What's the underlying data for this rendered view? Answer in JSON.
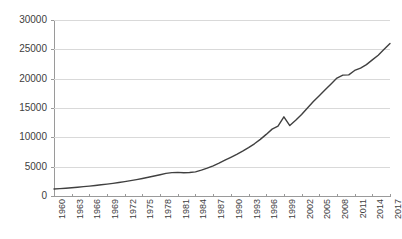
{
  "chart_data": {
    "type": "line",
    "title": "",
    "subtitle": "",
    "xlabel": "",
    "ylabel": "",
    "ylim": [
      0,
      30000
    ],
    "xlim": [
      1960,
      2017
    ],
    "grid": true,
    "legend": false,
    "legend_position": "none",
    "line_color": "#404040",
    "gridline_color": "#d9d9d9",
    "axis_color": "#9a9a9a",
    "y_ticks": [
      0,
      5000,
      10000,
      15000,
      20000,
      25000,
      30000
    ],
    "y_tick_labels": [
      "0",
      "5000",
      "10000",
      "15000",
      "20000",
      "25000",
      "30000"
    ],
    "x_tick_labels": [
      "1960",
      "1963",
      "1966",
      "1969",
      "1972",
      "1975",
      "1978",
      "1981",
      "1984",
      "1987",
      "1990",
      "1993",
      "1996",
      "1999",
      "2002",
      "2005",
      "2008",
      "2011",
      "2014",
      "2017"
    ],
    "x": [
      1960,
      1961,
      1962,
      1963,
      1964,
      1965,
      1966,
      1967,
      1968,
      1969,
      1970,
      1971,
      1972,
      1973,
      1974,
      1975,
      1976,
      1977,
      1978,
      1979,
      1980,
      1981,
      1982,
      1983,
      1984,
      1985,
      1986,
      1987,
      1988,
      1989,
      1990,
      1991,
      1992,
      1993,
      1994,
      1995,
      1996,
      1997,
      1998,
      1999,
      2000,
      2001,
      2002,
      2003,
      2004,
      2005,
      2006,
      2007,
      2008,
      2009,
      2010,
      2011,
      2012,
      2013,
      2014,
      2015,
      2016,
      2017
    ],
    "values": [
      1200,
      1260,
      1330,
      1410,
      1500,
      1590,
      1690,
      1800,
      1910,
      2030,
      2160,
      2300,
      2450,
      2620,
      2800,
      2990,
      3190,
      3400,
      3620,
      3850,
      3980,
      4020,
      3960,
      4010,
      4120,
      4400,
      4750,
      5150,
      5600,
      6100,
      6600,
      7100,
      7650,
      8250,
      8900,
      9650,
      10500,
      11400,
      11900,
      13500,
      12000,
      12900,
      13900,
      15000,
      16100,
      17100,
      18100,
      19100,
      20100,
      20600,
      20650,
      21400,
      21800,
      22400,
      23200,
      24000,
      25000,
      26000
    ],
    "series": [
      {
        "name": "series-1",
        "values": [
          1200,
          1260,
          1330,
          1410,
          1500,
          1590,
          1690,
          1800,
          1910,
          2030,
          2160,
          2300,
          2450,
          2620,
          2800,
          2990,
          3190,
          3400,
          3620,
          3850,
          3980,
          4020,
          3960,
          4010,
          4120,
          4400,
          4750,
          5150,
          5600,
          6100,
          6600,
          7100,
          7650,
          8250,
          8900,
          9650,
          10500,
          11400,
          11900,
          13500,
          12000,
          12900,
          13900,
          15000,
          16100,
          17100,
          18100,
          19100,
          20100,
          20600,
          20650,
          21400,
          21800,
          22400,
          23200,
          24000,
          25000,
          26000
        ]
      }
    ]
  }
}
